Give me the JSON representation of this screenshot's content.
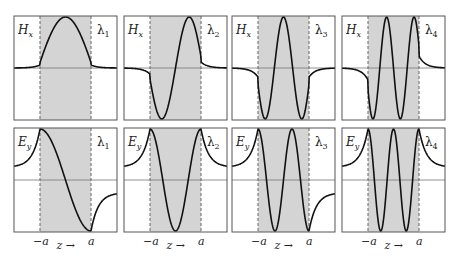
{
  "figure": {
    "rows": [
      {
        "field_label": "H",
        "field_sub": "x"
      },
      {
        "field_label": "E",
        "field_sub": "y"
      }
    ],
    "columns": [
      {
        "mode_label": "λ",
        "mode_sub": "1",
        "half_waves": 1
      },
      {
        "mode_label": "λ",
        "mode_sub": "2",
        "half_waves": 2
      },
      {
        "mode_label": "λ",
        "mode_sub": "3",
        "half_waves": 3
      },
      {
        "mode_label": "λ",
        "mode_sub": "4",
        "half_waves": 4
      }
    ],
    "axis": {
      "left_tick": "−a",
      "right_tick": "a",
      "axis_label": "z →"
    },
    "colors": {
      "shade": "#d4d4d4",
      "curve": "#111111",
      "frame": "#555555",
      "zero_line": "#777777",
      "dashed": "#666666"
    }
  }
}
